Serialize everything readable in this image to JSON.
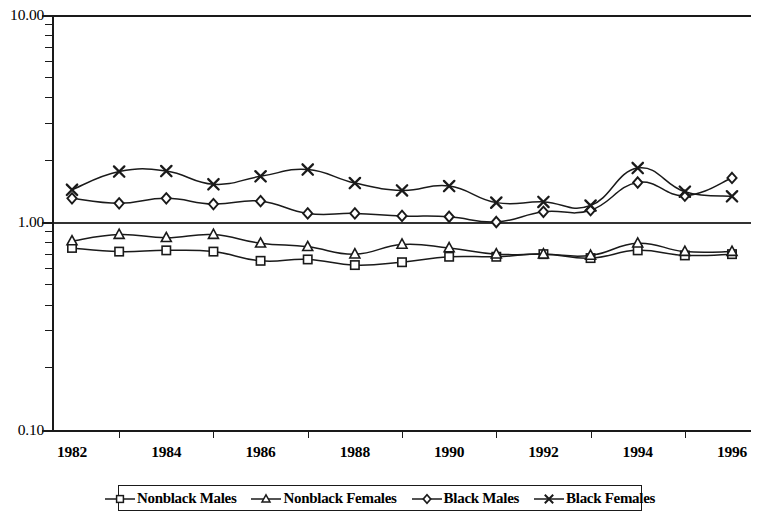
{
  "chart_data": {
    "type": "line",
    "title": "",
    "subtitle": "",
    "xlabel": "",
    "ylabel": "",
    "yscale": "log",
    "ylim": [
      0.1,
      10.0
    ],
    "ytick_labels": [
      "10.00",
      "1.00",
      "0.10"
    ],
    "ytick_values": [
      10.0,
      1.0,
      0.1
    ],
    "grid": "horizontal gridline at 1.00 only",
    "legend_position": "bottom-center-boxed",
    "xlim": [
      1982,
      1996
    ],
    "x": [
      1982,
      1983,
      1984,
      1985,
      1986,
      1987,
      1988,
      1989,
      1990,
      1991,
      1992,
      1993,
      1994,
      1995,
      1996
    ],
    "xtick_labels": [
      "1982",
      "1984",
      "1986",
      "1988",
      "1990",
      "1992",
      "1994",
      "1996"
    ],
    "series": [
      {
        "name": "Nonblack Males",
        "marker": "square",
        "values": [
          0.75,
          0.72,
          0.73,
          0.72,
          0.65,
          0.66,
          0.62,
          0.64,
          0.68,
          0.68,
          0.7,
          0.67,
          0.73,
          0.69,
          0.7
        ]
      },
      {
        "name": "Nonblack Females",
        "marker": "triangle",
        "values": [
          0.81,
          0.87,
          0.84,
          0.87,
          0.79,
          0.76,
          0.7,
          0.78,
          0.75,
          0.7,
          0.7,
          0.69,
          0.79,
          0.72,
          0.72
        ]
      },
      {
        "name": "Black Males",
        "marker": "diamond",
        "values": [
          1.3,
          1.23,
          1.3,
          1.22,
          1.26,
          1.1,
          1.1,
          1.07,
          1.06,
          1.0,
          1.12,
          1.14,
          1.55,
          1.34,
          1.63
        ]
      },
      {
        "name": "Black Females",
        "marker": "cross",
        "values": [
          1.43,
          1.75,
          1.76,
          1.52,
          1.66,
          1.79,
          1.54,
          1.42,
          1.49,
          1.24,
          1.25,
          1.2,
          1.82,
          1.4,
          1.33
        ]
      }
    ]
  },
  "legend": {
    "items": [
      {
        "label": "Nonblack Males",
        "marker": "square"
      },
      {
        "label": "Nonblack Females",
        "marker": "triangle"
      },
      {
        "label": "Black Males",
        "marker": "diamond"
      },
      {
        "label": "Black Females",
        "marker": "cross"
      }
    ]
  },
  "axes": {
    "y": {
      "labels": [
        "10.00",
        "1.00",
        "0.10"
      ]
    },
    "x": {
      "labels": [
        "1982",
        "1984",
        "1986",
        "1988",
        "1990",
        "1992",
        "1994",
        "1996"
      ]
    }
  },
  "colors": {
    "line": "#1a1a1a",
    "axis": "#1a1a1a",
    "grid": "#333333",
    "background": "#ffffff"
  }
}
